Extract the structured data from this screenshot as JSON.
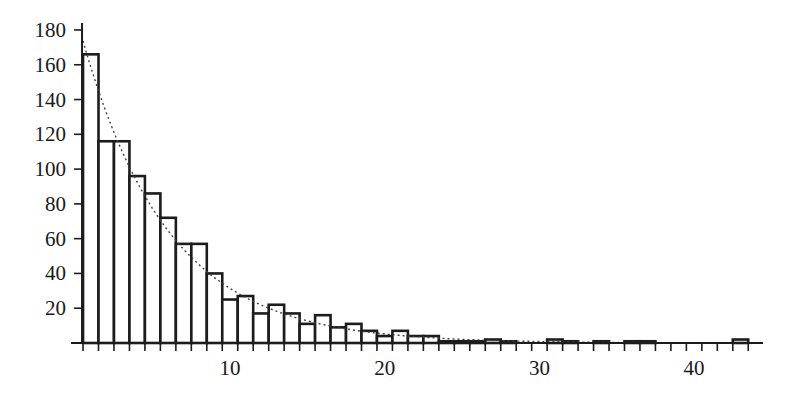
{
  "chart_data": {
    "type": "bar",
    "subtype": "histogram",
    "title": "",
    "xlabel": "",
    "ylabel": "",
    "bin_width": 1,
    "bin_centers": [
      1,
      2,
      3,
      4,
      5,
      6,
      7,
      8,
      9,
      10,
      11,
      12,
      13,
      14,
      15,
      16,
      17,
      18,
      19,
      20,
      21,
      22,
      23,
      24,
      25,
      26,
      27,
      28,
      29,
      30,
      31,
      32,
      33,
      34,
      35,
      36,
      37,
      38,
      39,
      40,
      41,
      42,
      43
    ],
    "values": [
      166,
      116,
      116,
      96,
      86,
      72,
      57,
      57,
      40,
      25,
      27,
      17,
      22,
      17,
      11,
      16,
      9,
      11,
      7,
      4,
      7,
      4,
      4,
      1,
      1,
      1,
      2,
      1,
      0,
      0,
      2,
      1,
      0,
      1,
      0,
      1,
      1,
      0,
      0,
      0,
      0,
      0,
      2
    ],
    "xlim": [
      0.5,
      44.5
    ],
    "ylim": [
      0,
      182
    ],
    "x_ticks": [
      10,
      20,
      30,
      40
    ],
    "y_ticks": [
      20,
      40,
      60,
      80,
      100,
      120,
      140,
      160,
      180
    ],
    "grid": false,
    "legend": null,
    "fit_curve": {
      "style": "dotted",
      "form": "exponential",
      "a": 190,
      "b": 0.18,
      "description": "y = a * exp(-b * x)"
    }
  }
}
